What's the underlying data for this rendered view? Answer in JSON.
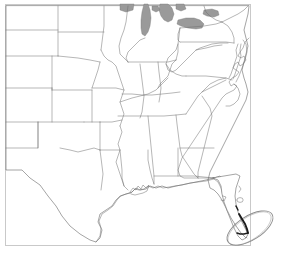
{
  "image": {
    "kind": "map",
    "title": "United States outline map - central and eastern states",
    "width": 283,
    "height": 260,
    "background_color": "#ffffff"
  },
  "map": {
    "frame": {
      "name": "map-border-frame",
      "color": "#c9c9c9",
      "x": 5,
      "y": 4,
      "width": 245,
      "height": 241
    },
    "style": {
      "land_fill": "#ffffff",
      "state_border_color": "#6e6e6e",
      "coastline_color": "#5a5a5a",
      "water_fill": "#9a9a9a"
    },
    "water_bodies": [
      {
        "name": "Lake Michigan",
        "color": "#9a9a9a"
      },
      {
        "name": "Lake Huron",
        "color": "#9a9a9a"
      },
      {
        "name": "Lake Erie",
        "color": "#9a9a9a"
      },
      {
        "name": "Lake Ontario",
        "color": "#9a9a9a"
      },
      {
        "name": "Chesapeake Bay",
        "color": "#ffffff"
      }
    ],
    "regions_shown": [
      "Montana",
      "North Dakota",
      "South Dakota",
      "Minnesota",
      "Wisconsin",
      "Michigan",
      "Wyoming",
      "Nebraska",
      "Iowa",
      "Illinois",
      "Indiana",
      "Ohio",
      "Pennsylvania",
      "New York",
      "New Jersey",
      "Colorado",
      "Kansas",
      "Missouri",
      "Kentucky",
      "West Virginia",
      "Virginia",
      "Maryland",
      "Delaware",
      "New Mexico",
      "Oklahoma",
      "Arkansas",
      "Tennessee",
      "North Carolina",
      "South Carolina",
      "Georgia",
      "Alabama",
      "Mississippi",
      "Louisiana",
      "Texas",
      "Florida"
    ]
  },
  "annotations": [
    {
      "name": "highlight-ellipse-south-florida",
      "shape": "ellipse",
      "target": "South Florida",
      "center_x": 250,
      "center_y": 228,
      "radius_x": 26,
      "radius_y": 12,
      "rotation_deg": -32,
      "stroke_color": "#8c8c8c",
      "style": "hand-drawn outline"
    },
    {
      "name": "highlight-stroke-florida-keys",
      "shape": "thick-stroke",
      "target": "Florida southern tip and Keys",
      "stroke_color": "#1b1b1b",
      "style": "bold traced coastline"
    }
  ]
}
